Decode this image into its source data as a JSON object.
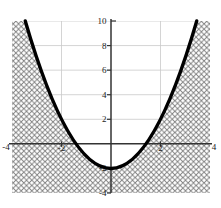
{
  "chart_data": {
    "type": "line",
    "title": "",
    "xlabel": "",
    "ylabel": "",
    "function": "y = x^2 - 2",
    "coefficients": {
      "a": 1,
      "b": 0,
      "c": -2
    },
    "xlim": [
      -4,
      4
    ],
    "ylim": [
      -4,
      10
    ],
    "x_ticks": [
      {
        "value": -4,
        "label": "-4"
      },
      {
        "value": -2,
        "label": "-2"
      },
      {
        "value": 2,
        "label": "2"
      },
      {
        "value": 4,
        "label": "4"
      }
    ],
    "y_ticks": [
      {
        "value": -4,
        "label": "-4"
      },
      {
        "value": -2,
        "label": "-2"
      },
      {
        "value": 2,
        "label": "2"
      },
      {
        "value": 4,
        "label": "4"
      },
      {
        "value": 6,
        "label": "6"
      },
      {
        "value": 8,
        "label": "8"
      },
      {
        "value": 10,
        "label": "10"
      }
    ],
    "h_gridlines": [
      2,
      4,
      6,
      8,
      10
    ],
    "v_gridlines": [
      -2,
      2
    ],
    "grid": "on",
    "legend": "none",
    "shaded_region": "y <= x^2 - 2 (crosshatched)",
    "curve_points": [
      [
        -3.46,
        10
      ],
      [
        -3,
        7
      ],
      [
        -2.5,
        4.25
      ],
      [
        -2,
        2
      ],
      [
        -1.5,
        0.25
      ],
      [
        -1,
        -1
      ],
      [
        -0.5,
        -1.75
      ],
      [
        0,
        -2
      ],
      [
        0.5,
        -1.75
      ],
      [
        1,
        -1
      ],
      [
        1.5,
        0.25
      ],
      [
        2,
        2
      ],
      [
        2.5,
        4.25
      ],
      [
        3,
        7
      ],
      [
        3.46,
        10
      ]
    ],
    "colors": {
      "curve": "#000000",
      "axis": "#333333",
      "gridline": "#c9c9c9",
      "hatch_line": "#7d7d7d",
      "region_fill": "#ffffff",
      "label": "#222222",
      "background": "#ffffff"
    }
  }
}
